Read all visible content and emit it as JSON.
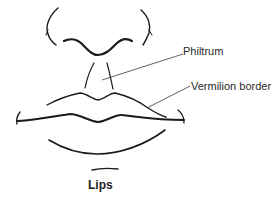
{
  "figure": {
    "caption": "Lips",
    "labels": {
      "philtrum": "Philtrum",
      "vermilion_border": "Vermilion border"
    },
    "parts": [
      "nose",
      "philtrum",
      "upper-lip",
      "lip-line",
      "lower-lip",
      "chin"
    ],
    "colors": {
      "background": "#ffffff",
      "stroke": "#1a1a1a",
      "text": "#2a2a2a"
    }
  }
}
